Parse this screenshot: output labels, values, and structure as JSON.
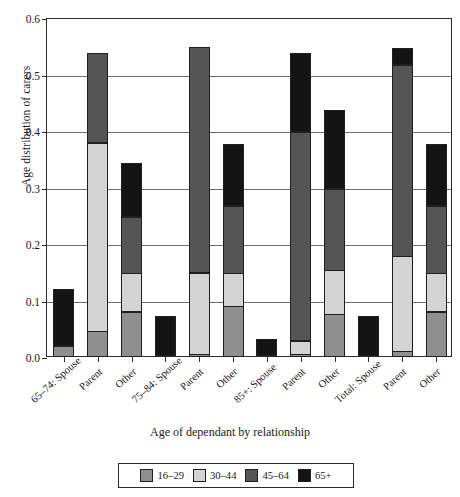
{
  "chart_data": {
    "type": "bar",
    "stacked": true,
    "title": "",
    "xlabel": "Age of dependant by relationship",
    "ylabel": "Age distribution of carers",
    "ylim": [
      0,
      0.6
    ],
    "ytick_labels": [
      "0.0",
      "0.1",
      "0.2",
      "0.3",
      "0.4",
      "0.5",
      "0.6"
    ],
    "ytick_values": [
      0.0,
      0.1,
      0.2,
      0.3,
      0.4,
      0.5,
      0.6
    ],
    "grid": true,
    "legend_position": "bottom",
    "categories": [
      "65–74: Spouse",
      "Parent",
      "Other",
      "75–84: Spouse",
      "Parent",
      "Other",
      "85+: Spouse",
      "Parent",
      "Other",
      "Total: Spouse",
      "Parent",
      "Other"
    ],
    "series": [
      {
        "name": "16–29",
        "color": "#8f8f8f",
        "values": [
          0.02,
          0.045,
          0.08,
          0.0,
          0.005,
          0.09,
          0.0,
          0.005,
          0.075,
          0.0,
          0.01,
          0.08
        ]
      },
      {
        "name": "30–44",
        "color": "#d4d4d4",
        "values": [
          0.0,
          0.335,
          0.07,
          0.0,
          0.145,
          0.06,
          0.0,
          0.025,
          0.08,
          0.0,
          0.17,
          0.07
        ]
      },
      {
        "name": "45–64",
        "color": "#555555",
        "values": [
          0.0,
          0.16,
          0.1,
          0.0,
          0.4,
          0.12,
          0.0,
          0.37,
          0.145,
          0.0,
          0.34,
          0.12
        ]
      },
      {
        "name": "65+",
        "color": "#141414",
        "values": [
          0.1,
          0.0,
          0.095,
          0.07,
          0.0,
          0.11,
          0.03,
          0.14,
          0.14,
          0.07,
          0.03,
          0.11
        ]
      }
    ],
    "totals": [
      0.12,
      0.54,
      0.345,
      0.07,
      0.55,
      0.38,
      0.03,
      0.54,
      0.44,
      0.07,
      0.55,
      0.38
    ]
  }
}
